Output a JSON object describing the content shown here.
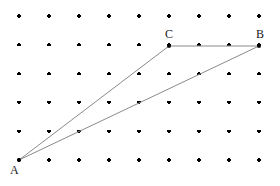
{
  "figure": {
    "kind": "dot-grid-geometry-figure",
    "width": 280,
    "height": 186,
    "background_color": "#ffffff"
  },
  "grid": {
    "columns": 9,
    "rows": 6,
    "origin_x": 19,
    "origin_y": 16,
    "spacing_x": 30,
    "spacing_y": 28.8,
    "dot_color": "#000000",
    "dot_size": 3.2
  },
  "shape": {
    "name": "triangle ABC",
    "stroke_color": "#8a8a8a",
    "stroke_width": 1,
    "vertices": [
      {
        "id": "A",
        "label": "A",
        "x": 19,
        "y": 160,
        "col": 1,
        "row": 6,
        "label_dx": -9,
        "label_dy": 4
      },
      {
        "id": "C",
        "label": "C",
        "x": 169,
        "y": 46,
        "col": 6,
        "row": 2,
        "label_dx": -4,
        "label_dy": -18
      },
      {
        "id": "B",
        "label": "B",
        "x": 259,
        "y": 46,
        "col": 9,
        "row": 2,
        "label_dx": -3,
        "label_dy": -18
      }
    ],
    "edges": [
      {
        "id": "AC",
        "from": "A",
        "to": "C"
      },
      {
        "id": "CB",
        "from": "C",
        "to": "B"
      },
      {
        "id": "AB",
        "from": "A",
        "to": "B"
      }
    ],
    "vertex_marker_color": "#000000",
    "vertex_marker_size": 3.6
  },
  "chart_data": {
    "type": "scatter",
    "title": "",
    "xlabel": "",
    "ylabel": "",
    "grid": true,
    "legend_position": "none",
    "xlim": [
      0,
      10
    ],
    "ylim": [
      0,
      7
    ],
    "lattice_points": {
      "x": [
        1,
        2,
        3,
        4,
        5,
        6,
        7,
        8,
        9
      ],
      "y": [
        1,
        2,
        3,
        4,
        5,
        6
      ]
    },
    "annotations": [
      {
        "text": "A",
        "x": 1,
        "y": 1
      },
      {
        "text": "C",
        "x": 6,
        "y": 5
      },
      {
        "text": "B",
        "x": 9,
        "y": 5
      }
    ],
    "series": [
      {
        "name": "triangle ABC",
        "x": [
          1,
          6,
          9,
          1
        ],
        "y": [
          1,
          5,
          5,
          1
        ]
      }
    ]
  }
}
